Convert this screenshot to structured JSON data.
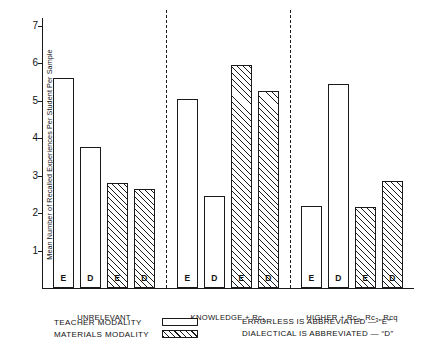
{
  "chart_data": {
    "type": "bar",
    "title": "",
    "xlabel": "",
    "ylabel": "Mean Number of Recalled Experiences Per Student  Per Sample",
    "ylim": [
      0,
      7.2
    ],
    "yticks": [
      1,
      2,
      3,
      4,
      5,
      6,
      7
    ],
    "ytick_labels": [
      "1",
      "2",
      "3",
      "4",
      "5",
      "6",
      "7"
    ],
    "grid": false,
    "legend_position": "below-axes",
    "groups": [
      {
        "label": "UNRELEVANT",
        "label_parts": [
          {
            "text": "UNRELEVANT",
            "sub": ""
          }
        ],
        "bars": [
          {
            "letter": "E",
            "modality": "TEACHER MODALITY",
            "value": 5.6
          },
          {
            "letter": "D",
            "modality": "TEACHER MODALITY",
            "value": 3.75
          },
          {
            "letter": "E",
            "modality": "MATERIALS MODALITY",
            "value": 2.8
          },
          {
            "letter": "D",
            "modality": "MATERIALS MODALITY",
            "value": 2.65
          }
        ]
      },
      {
        "label": "KNOWLEDGE + Rc1",
        "label_parts": [
          {
            "text": "KNOWLEDGE + Rc",
            "sub": "1"
          }
        ],
        "bars": [
          {
            "letter": "E",
            "modality": "TEACHER MODALITY",
            "value": 5.05
          },
          {
            "letter": "D",
            "modality": "TEACHER MODALITY",
            "value": 2.45
          },
          {
            "letter": "E",
            "modality": "MATERIALS MODALITY",
            "value": 5.95
          },
          {
            "letter": "D",
            "modality": "MATERIALS MODALITY",
            "value": 5.25
          }
        ]
      },
      {
        "label": "HIGHER + Rc2, Rc3, Rcq",
        "label_parts": [
          {
            "text": "HIGHER + Rc",
            "sub": "2"
          },
          {
            "text": ", Rc",
            "sub": "3"
          },
          {
            "text": ", Rcq",
            "sub": ""
          }
        ],
        "bars": [
          {
            "letter": "E",
            "modality": "TEACHER MODALITY",
            "value": 2.2
          },
          {
            "letter": "D",
            "modality": "TEACHER MODALITY",
            "value": 5.45
          },
          {
            "letter": "E",
            "modality": "MATERIALS MODALITY",
            "value": 2.15
          },
          {
            "letter": "D",
            "modality": "MATERIALS MODALITY",
            "value": 2.85
          }
        ]
      }
    ],
    "series": [
      {
        "name": "TEACHER MODALITY",
        "values": [
          5.6,
          3.75,
          5.05,
          2.45,
          2.2,
          5.45
        ]
      },
      {
        "name": "MATERIALS MODALITY",
        "values": [
          2.8,
          2.65,
          5.95,
          5.25,
          2.15,
          2.85
        ]
      }
    ],
    "legend": {
      "teacher_label": "TEACHER MODALITY",
      "materials_label": "MATERIALS MODALITY",
      "teacher_swatch": "open-white-rectangle",
      "materials_swatch": "diagonal-hatched-rectangle"
    },
    "annotations": [
      "ERRORLESS IS ABBREVIATED — “E”",
      "DIALECTICAL IS ABBREVIATED — “D”"
    ],
    "colors": {
      "ink": "#1a1a1a",
      "background": "#ffffff"
    }
  },
  "legend": {
    "teacher": "TEACHER MODALITY",
    "materials": "MATERIALS MODALITY",
    "note_errorless": "ERRORLESS IS ABBREVIATED — “E”",
    "note_dialectical": "DIALECTICAL IS ABBREVIATED — “D”"
  }
}
